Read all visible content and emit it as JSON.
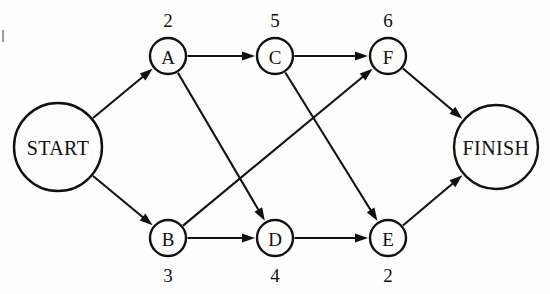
{
  "diagram": {
    "type": "activity-on-node-network",
    "background_color": "#fdfdfc",
    "line_color": "#111111",
    "nodes": [
      {
        "id": "START",
        "label": "START",
        "shape": "circle",
        "kind": "terminal",
        "cx": 58,
        "cy": 147,
        "r": 44,
        "duration": null,
        "duration_position": null
      },
      {
        "id": "A",
        "label": "A",
        "shape": "circle",
        "kind": "activity",
        "cx": 168,
        "cy": 56,
        "r": 18,
        "duration": "2",
        "duration_position": "above"
      },
      {
        "id": "C",
        "label": "C",
        "shape": "circle",
        "kind": "activity",
        "cx": 275,
        "cy": 56,
        "r": 18,
        "duration": "5",
        "duration_position": "above"
      },
      {
        "id": "F",
        "label": "F",
        "shape": "circle",
        "kind": "activity",
        "cx": 388,
        "cy": 56,
        "r": 18,
        "duration": "6",
        "duration_position": "above"
      },
      {
        "id": "B",
        "label": "B",
        "shape": "circle",
        "kind": "activity",
        "cx": 168,
        "cy": 238,
        "r": 18,
        "duration": "3",
        "duration_position": "below"
      },
      {
        "id": "D",
        "label": "D",
        "shape": "circle",
        "kind": "activity",
        "cx": 275,
        "cy": 238,
        "r": 18,
        "duration": "4",
        "duration_position": "below"
      },
      {
        "id": "E",
        "label": "E",
        "shape": "circle",
        "kind": "activity",
        "cx": 388,
        "cy": 238,
        "r": 18,
        "duration": "2",
        "duration_position": "below"
      },
      {
        "id": "FINISH",
        "label": "FINISH",
        "shape": "circle",
        "kind": "terminal",
        "cx": 496,
        "cy": 147,
        "r": 42,
        "duration": null,
        "duration_position": null
      }
    ],
    "edges": [
      {
        "from": "START",
        "to": "A",
        "arrow": true
      },
      {
        "from": "START",
        "to": "B",
        "arrow": true
      },
      {
        "from": "A",
        "to": "C",
        "arrow": true
      },
      {
        "from": "A",
        "to": "D",
        "arrow": true
      },
      {
        "from": "B",
        "to": "D",
        "arrow": true
      },
      {
        "from": "B",
        "to": "F",
        "arrow": true
      },
      {
        "from": "C",
        "to": "F",
        "arrow": true
      },
      {
        "from": "C",
        "to": "E",
        "arrow": true
      },
      {
        "from": "D",
        "to": "E",
        "arrow": true
      },
      {
        "from": "E",
        "to": "FINISH",
        "arrow": true
      },
      {
        "from": "F",
        "to": "FINISH",
        "arrow": true
      }
    ]
  }
}
